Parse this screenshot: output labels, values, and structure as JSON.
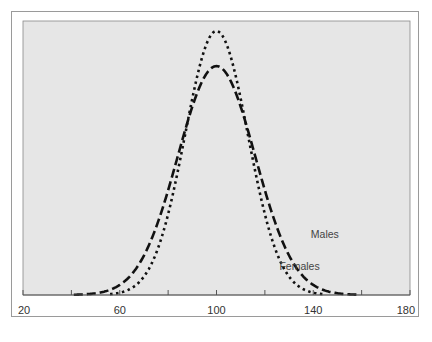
{
  "chart_data": {
    "type": "line",
    "title": "",
    "xlabel": "",
    "ylabel": "",
    "xlim": [
      20,
      180
    ],
    "x_ticks": [
      20,
      40,
      60,
      80,
      100,
      120,
      140,
      160,
      180
    ],
    "x_tick_labels": [
      "20",
      "",
      "60",
      "",
      "100",
      "",
      "140",
      "",
      "180"
    ],
    "grid": false,
    "legend": "inline labels",
    "series": [
      {
        "name": "Males",
        "style": "dashed",
        "distribution": "normal",
        "mean": 100,
        "sd": 16,
        "relative_peak_height": 0.867,
        "x_range": [
          41,
          159
        ],
        "label_position": {
          "x": 139,
          "y": 238
        }
      },
      {
        "name": "Females",
        "style": "dotted",
        "distribution": "normal",
        "mean": 100,
        "sd": 13,
        "relative_peak_height": 1.0,
        "x_range": [
          56,
          144
        ],
        "label_position": {
          "x": 126,
          "y": 270
        }
      }
    ]
  },
  "colors": {
    "plot_background": "#e6e6e6",
    "line": "#111111",
    "axis": "#555555",
    "frame": "#9a9a9a"
  }
}
